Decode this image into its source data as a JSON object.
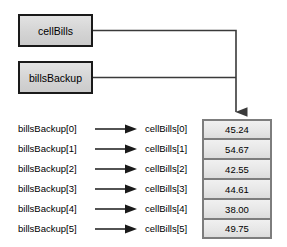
{
  "diagram": {
    "reference_boxes": [
      {
        "label": "cellBills",
        "name": "cellbills"
      },
      {
        "label": "billsBackup",
        "name": "billsbackup"
      }
    ],
    "rows": [
      {
        "backup_label": "billsBackup[0]",
        "cell_label": "cellBills[0]",
        "value": "45.24"
      },
      {
        "backup_label": "billsBackup[1]",
        "cell_label": "cellBills[1]",
        "value": "54.67"
      },
      {
        "backup_label": "billsBackup[2]",
        "cell_label": "cellBills[2]",
        "value": "42.55"
      },
      {
        "backup_label": "billsBackup[3]",
        "cell_label": "cellBills[3]",
        "value": "44.61"
      },
      {
        "backup_label": "billsBackup[4]",
        "cell_label": "cellBills[4]",
        "value": "38.00"
      },
      {
        "backup_label": "billsBackup[5]",
        "cell_label": "cellBills[5]",
        "value": "49.75"
      }
    ],
    "colors": {
      "box_fill": "#d8d8d8",
      "box_border": "#1a1a1a",
      "cell_fill": "#e8e8e8",
      "cell_border": "#7d7d7d",
      "connector": "#3a3a3a"
    }
  }
}
